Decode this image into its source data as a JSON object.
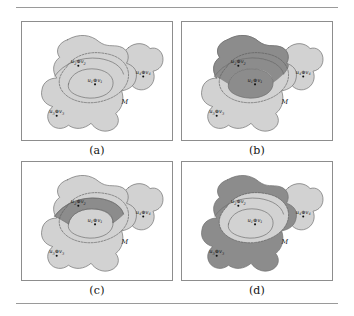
{
  "figure": {
    "rules": {
      "top": true,
      "bottom": true
    },
    "colors": {
      "light_fill": "#d2d2d2",
      "dark_fill": "#8c8c8c",
      "outline": "#6f6f6f",
      "dashed": "#5a5a5a",
      "panel_border": "#8d8d8d",
      "rule": "#9a9a9a",
      "marker": "#101010",
      "background": "#ffffff"
    },
    "m_label": "M",
    "operator": "⊕",
    "panels": [
      {
        "id": "a",
        "caption": "(a)",
        "shaded_regions": [],
        "labels": [
          {
            "name": "u1v1",
            "u": "u",
            "usub": "1",
            "v": "v",
            "vsub": "1"
          },
          {
            "name": "u2v2",
            "u": "u",
            "usub": "2",
            "v": "v",
            "vsub": "2"
          },
          {
            "name": "u3v3",
            "u": "u",
            "usub": "3",
            "v": "v",
            "vsub": "3"
          },
          {
            "name": "u4v4",
            "u": "u",
            "usub": "4",
            "v": "v",
            "vsub": "4"
          }
        ]
      },
      {
        "id": "b",
        "caption": "(b)",
        "shaded_regions": [
          "upper-lobe",
          "inner-u1"
        ],
        "labels": [
          {
            "name": "u1v1",
            "u": "u",
            "usub": "1",
            "v": "v",
            "vsub": "1"
          },
          {
            "name": "u2v2",
            "u": "u",
            "usub": "2",
            "v": "v",
            "vsub": "2"
          },
          {
            "name": "u3v3",
            "u": "u",
            "usub": "3",
            "v": "v",
            "vsub": "3"
          },
          {
            "name": "u4v4",
            "u": "u",
            "usub": "4",
            "v": "v",
            "vsub": "4"
          }
        ]
      },
      {
        "id": "c",
        "caption": "(c)",
        "shaded_regions": [
          "crescent-band"
        ],
        "labels": [
          {
            "name": "u1v1",
            "u": "u",
            "usub": "1",
            "v": "v",
            "vsub": "1"
          },
          {
            "name": "u2v2",
            "u": "u",
            "usub": "2",
            "v": "v",
            "vsub": "2"
          },
          {
            "name": "u3v3",
            "u": "u",
            "usub": "3",
            "v": "v",
            "vsub": "3"
          },
          {
            "name": "u4v4",
            "u": "u",
            "usub": "4",
            "v": "v",
            "vsub": "4"
          }
        ]
      },
      {
        "id": "d",
        "caption": "(d)",
        "shaded_regions": [
          "outside-m"
        ],
        "labels": [
          {
            "name": "u1v1",
            "u": "u",
            "usub": "1",
            "v": "v",
            "vsub": "1"
          },
          {
            "name": "u2v2",
            "u": "u",
            "usub": "2",
            "v": "v",
            "vsub": "2"
          },
          {
            "name": "u3v3",
            "u": "u",
            "usub": "3",
            "v": "v",
            "vsub": "3"
          },
          {
            "name": "u4v4",
            "u": "u",
            "usub": "4",
            "v": "v",
            "vsub": "4"
          }
        ]
      }
    ],
    "marker_positions": {
      "u1v1": {
        "x": 74,
        "y": 61
      },
      "u2v2": {
        "x": 57,
        "y": 42
      },
      "u3v3": {
        "x": 35,
        "y": 93
      },
      "u4v4": {
        "x": 123,
        "y": 53
      },
      "m": {
        "x": 101,
        "y": 83
      }
    }
  }
}
